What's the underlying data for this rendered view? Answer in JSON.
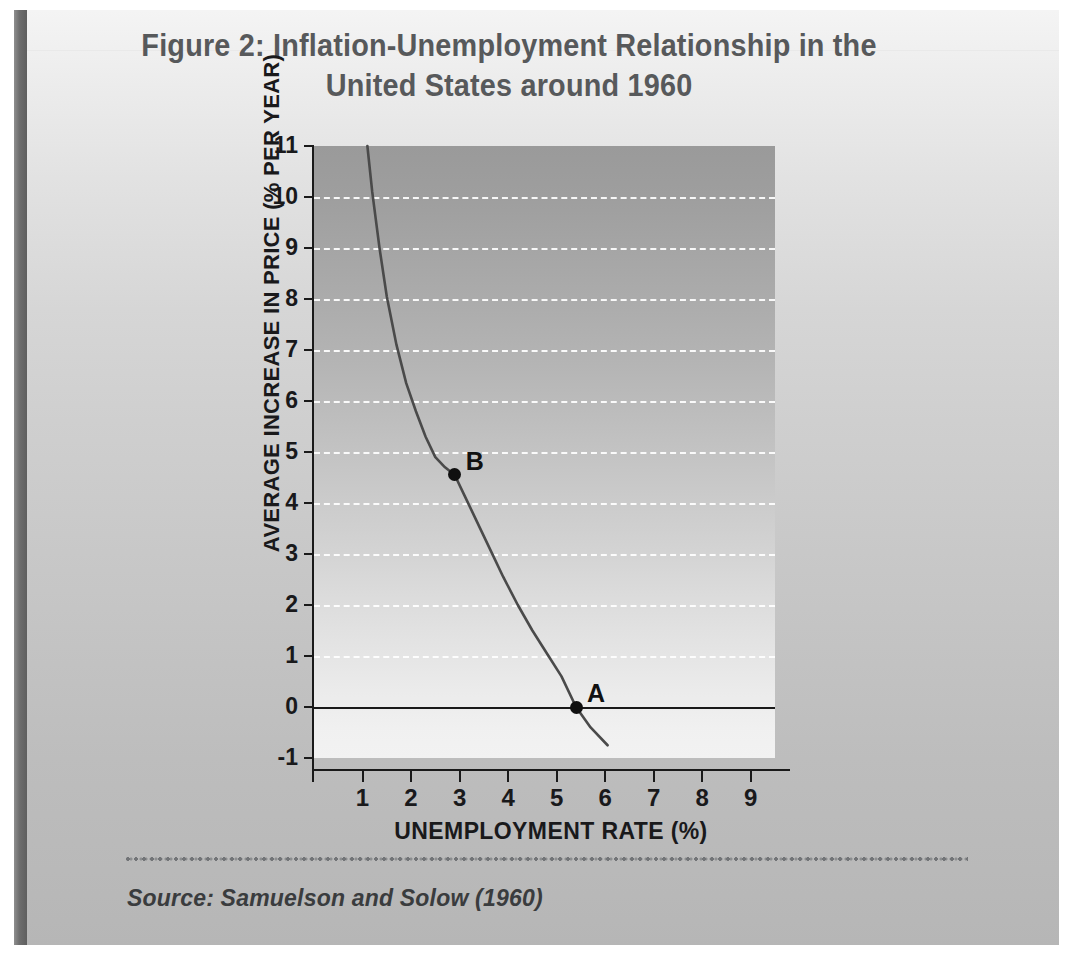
{
  "figure": {
    "title_line_1": "Figure 2: Inflation-Unemployment Relationship in the",
    "title_line_2": "United States around 1960",
    "source_note": "Source: Samuelson and Solow (1960)",
    "title_color": "#57595b",
    "panel_background_top": "#f4f4f4",
    "panel_background_bottom": "#b6b6b6",
    "spine_color": "#6e6e6e"
  },
  "chart_data": {
    "type": "line",
    "title": "Figure 2: Inflation-Unemployment Relationship in the United States around 1960",
    "subtitle": "",
    "xlabel": "UNEMPLOYMENT RATE (%)",
    "ylabel": "AVERAGE INCREASE IN PRICE (% PER YEAR)",
    "xlim": [
      0,
      9.5
    ],
    "ylim": [
      -1,
      11
    ],
    "xticks": [
      1,
      2,
      3,
      4,
      5,
      6,
      7,
      8,
      9
    ],
    "xtick_labels": [
      "1",
      "2",
      "3",
      "4",
      "5",
      "6",
      "7",
      "8",
      "9"
    ],
    "yticks": [
      -1,
      0,
      1,
      2,
      3,
      4,
      5,
      6,
      7,
      8,
      9,
      10,
      11
    ],
    "ytick_labels": [
      "-1",
      "0",
      "1",
      "2",
      "3",
      "4",
      "5",
      "6",
      "7",
      "8",
      "9",
      "10",
      "11"
    ],
    "grid": true,
    "grid_style": "dashed-white-horizontal",
    "zero_line": 0,
    "legend": null,
    "legend_position": "none",
    "series": [
      {
        "name": "Phillips curve (Samuelson-Solow)",
        "color": "#4a4a4a",
        "x": [
          1.1,
          1.2,
          1.35,
          1.5,
          1.7,
          1.9,
          2.1,
          2.3,
          2.5,
          2.7,
          2.9,
          3.1,
          3.35,
          3.6,
          3.9,
          4.2,
          4.5,
          4.8,
          5.1,
          5.4,
          5.7,
          6.05
        ],
        "y": [
          11.0,
          10.1,
          9.0,
          8.05,
          7.1,
          6.35,
          5.8,
          5.3,
          4.9,
          4.7,
          4.55,
          4.15,
          3.65,
          3.15,
          2.55,
          2.0,
          1.5,
          1.05,
          0.6,
          0.0,
          -0.4,
          -0.75
        ]
      }
    ],
    "annotations": [
      {
        "label": "A",
        "x": 5.4,
        "y": 0.0,
        "marker": "filled-circle",
        "label_offset": "right-above"
      },
      {
        "label": "B",
        "x": 2.9,
        "y": 4.55,
        "marker": "filled-circle",
        "label_offset": "right-above"
      }
    ]
  }
}
